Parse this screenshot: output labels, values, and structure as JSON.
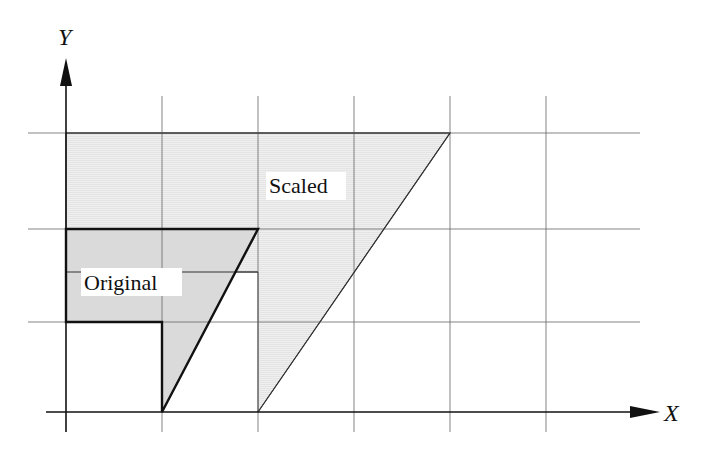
{
  "diagram": {
    "type": "scaling-transformation",
    "axes": {
      "x_label": "X",
      "y_label": "Y",
      "origin_px": [
        66,
        412
      ],
      "unit_px": [
        96,
        93
      ]
    },
    "grid": {
      "x_lines": [
        0,
        1,
        2,
        3,
        4,
        5
      ],
      "y_lines": [
        0,
        1,
        2,
        3
      ],
      "color": "#555555"
    },
    "shapes": [
      {
        "name": "Original",
        "label": "Original",
        "vertices": [
          [
            1,
            0
          ],
          [
            2,
            2
          ],
          [
            0,
            2
          ],
          [
            0,
            1
          ],
          [
            1,
            1
          ]
        ],
        "fill": "#d9d9d9",
        "stroke": "#111111"
      },
      {
        "name": "Scaled",
        "label": "Scaled",
        "scale_factors": [
          2,
          1.5
        ],
        "vertices": [
          [
            2,
            0
          ],
          [
            4,
            3
          ],
          [
            0,
            3
          ],
          [
            0,
            1.5
          ],
          [
            2,
            1.5
          ]
        ],
        "fill": "#ececec",
        "stroke": "#333333"
      }
    ]
  }
}
